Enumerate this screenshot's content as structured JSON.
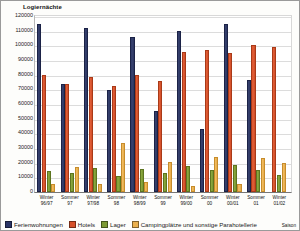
{
  "chart_data": {
    "type": "bar",
    "title": "",
    "ylabel": "Logiernächte",
    "xlabel": "Saison",
    "ylim": [
      0,
      120000
    ],
    "ytick_step": 10000,
    "yticks": [
      "120000",
      "110000",
      "100000",
      "90000",
      "80000",
      "70000",
      "60000",
      "50000",
      "40000",
      "30000",
      "20000",
      "10000",
      "0"
    ],
    "grid": true,
    "legend_position": "bottom-left",
    "categories": [
      "Winter 96/97",
      "Sommer 97",
      "Winter 97/98",
      "Sommer 98",
      "Winter 98/99",
      "Sommer 99",
      "Winter 99/00",
      "Sommer 00",
      "Winter 00/01",
      "Sommer 01",
      "Winter 01/02"
    ],
    "category_lines": [
      [
        "Winter",
        "96/97"
      ],
      [
        "Sommer",
        "97"
      ],
      [
        "Winter",
        "97/98"
      ],
      [
        "Sommer",
        "98"
      ],
      [
        "Winter",
        "98/99"
      ],
      [
        "Sommer",
        "99"
      ],
      [
        "Winter",
        "99/00"
      ],
      [
        "Sommer",
        "00"
      ],
      [
        "Winter",
        "00/01"
      ],
      [
        "Sommer",
        "01"
      ],
      [
        "Winter",
        "01/02"
      ]
    ],
    "series": [
      {
        "name": "Ferienwohnungen",
        "color": "#2b3566",
        "values": [
          114500,
          73500,
          112000,
          69800,
          105500,
          55500,
          110000,
          43000,
          114500,
          76500,
          null
        ]
      },
      {
        "name": "Hotels",
        "color": "#d6502a",
        "values": [
          79500,
          73800,
          78500,
          72500,
          79500,
          76000,
          95500,
          96500,
          95000,
          100500,
          99000
        ]
      },
      {
        "name": "Lager",
        "color": "#7d9a34",
        "values": [
          14500,
          12800,
          16400,
          10800,
          15700,
          13000,
          17500,
          15300,
          18200,
          15000,
          11500
        ]
      },
      {
        "name": "Campingplätze und sonstige Parahotellerie",
        "color": "#eab04e",
        "values": [
          5300,
          17200,
          5400,
          33500,
          6800,
          20800,
          4400,
          24000,
          5500,
          23500,
          19500
        ]
      }
    ]
  },
  "legend": {
    "items": [
      {
        "label": "Ferienwohnungen"
      },
      {
        "label": "Hotels"
      },
      {
        "label": "Lager"
      },
      {
        "label": "Campingplätze und sonstige Parahotellerie"
      }
    ]
  }
}
